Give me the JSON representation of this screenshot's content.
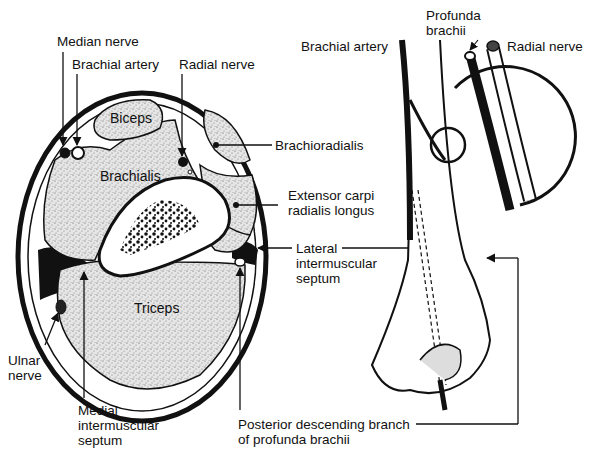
{
  "figure": {
    "cross_section": {
      "muscles": {
        "biceps": "Biceps",
        "brachialis": "Brachialis",
        "triceps": "Triceps"
      },
      "labels": {
        "median_nerve": "Median nerve",
        "brachial_artery": "Brachial artery",
        "radial_nerve": "Radial nerve",
        "brachioradialis": "Brachioradialis",
        "extensor": "Extensor carpi\nradialis longus",
        "lateral_septum": "Lateral\nintermuscular\nseptum",
        "ulnar_nerve": "Ulnar\nnerve",
        "medial_septum": "Medial\nintermuscular\nseptum",
        "posterior_branch": "Posterior descending branch\nof profunda brachii"
      }
    },
    "side_view": {
      "labels": {
        "brachial_artery": "Brachial artery",
        "profunda_brachii": "Profunda\nbrachii",
        "radial_nerve": "Radial nerve"
      }
    },
    "colors": {
      "ink": "#111111",
      "background": "#ffffff",
      "stipple_fill": "#d9d9d9"
    }
  }
}
